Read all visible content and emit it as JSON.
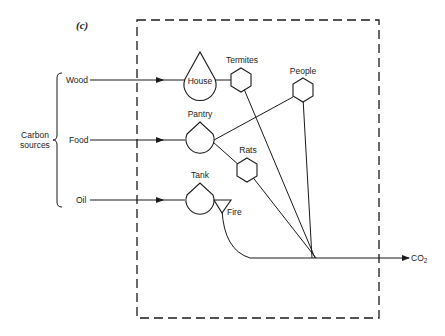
{
  "figure": {
    "panel_label": "(c)",
    "system_boundary": "dashed-box",
    "sources_group_label_line1": "Carbon",
    "sources_group_label_line2": "sources",
    "sources": [
      {
        "label": "Wood"
      },
      {
        "label": "Food"
      },
      {
        "label": "Oil"
      }
    ],
    "storages": [
      {
        "label": "House"
      },
      {
        "label": "Pantry"
      },
      {
        "label": "Tank"
      }
    ],
    "consumers": [
      {
        "label": "Termites"
      },
      {
        "label": "People"
      },
      {
        "label": "Rats"
      }
    ],
    "process": {
      "label": "Fire"
    },
    "output": {
      "label": "CO",
      "subscript": "2"
    },
    "colors": {
      "ink": "#1a1a1a",
      "background": "#ffffff"
    }
  }
}
